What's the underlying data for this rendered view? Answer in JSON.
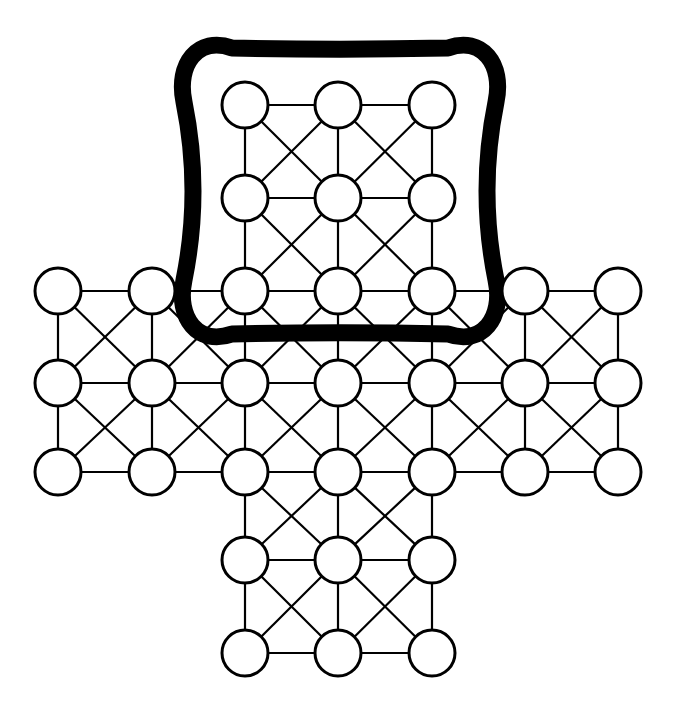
{
  "figure": {
    "background_color": "#ffffff",
    "stroke_color": "#000000",
    "node_fill_color": "#ffffff",
    "width": 683,
    "height": 707
  },
  "chart_data": {
    "type": "diagram",
    "xlabel": "",
    "ylabel": "",
    "grid": false,
    "legend": "none",
    "node_radius": 23,
    "column_x": [
      58,
      152,
      245,
      338,
      432,
      525,
      618
    ],
    "row_y": [
      105,
      198,
      291,
      383,
      472,
      560,
      653
    ],
    "node_count": 33,
    "nodes": [
      {
        "id": "n-r0c2",
        "row": 0,
        "col": 2,
        "x": 245,
        "y": 105,
        "highlighted": true
      },
      {
        "id": "n-r0c3",
        "row": 0,
        "col": 3,
        "x": 338,
        "y": 105,
        "highlighted": true
      },
      {
        "id": "n-r0c4",
        "row": 0,
        "col": 4,
        "x": 432,
        "y": 105,
        "highlighted": true
      },
      {
        "id": "n-r1c2",
        "row": 1,
        "col": 2,
        "x": 245,
        "y": 198,
        "highlighted": true
      },
      {
        "id": "n-r1c3",
        "row": 1,
        "col": 3,
        "x": 338,
        "y": 198,
        "highlighted": true
      },
      {
        "id": "n-r1c4",
        "row": 1,
        "col": 4,
        "x": 432,
        "y": 198,
        "highlighted": true
      },
      {
        "id": "n-r2c0",
        "row": 2,
        "col": 0,
        "x": 58,
        "y": 291,
        "highlighted": false
      },
      {
        "id": "n-r2c1",
        "row": 2,
        "col": 1,
        "x": 152,
        "y": 291,
        "highlighted": false
      },
      {
        "id": "n-r2c2",
        "row": 2,
        "col": 2,
        "x": 245,
        "y": 291,
        "highlighted": true
      },
      {
        "id": "n-r2c3",
        "row": 2,
        "col": 3,
        "x": 338,
        "y": 291,
        "highlighted": true
      },
      {
        "id": "n-r2c4",
        "row": 2,
        "col": 4,
        "x": 432,
        "y": 291,
        "highlighted": true
      },
      {
        "id": "n-r2c5",
        "row": 2,
        "col": 5,
        "x": 525,
        "y": 291,
        "highlighted": false
      },
      {
        "id": "n-r2c6",
        "row": 2,
        "col": 6,
        "x": 618,
        "y": 291,
        "highlighted": false
      },
      {
        "id": "n-r3c0",
        "row": 3,
        "col": 0,
        "x": 58,
        "y": 383,
        "highlighted": false
      },
      {
        "id": "n-r3c1",
        "row": 3,
        "col": 1,
        "x": 152,
        "y": 383,
        "highlighted": false
      },
      {
        "id": "n-r3c2",
        "row": 3,
        "col": 2,
        "x": 245,
        "y": 383,
        "highlighted": false
      },
      {
        "id": "n-r3c3",
        "row": 3,
        "col": 3,
        "x": 338,
        "y": 383,
        "highlighted": false
      },
      {
        "id": "n-r3c4",
        "row": 3,
        "col": 4,
        "x": 432,
        "y": 383,
        "highlighted": false
      },
      {
        "id": "n-r3c5",
        "row": 3,
        "col": 5,
        "x": 525,
        "y": 383,
        "highlighted": false
      },
      {
        "id": "n-r3c6",
        "row": 3,
        "col": 6,
        "x": 618,
        "y": 383,
        "highlighted": false
      },
      {
        "id": "n-r4c0",
        "row": 4,
        "col": 0,
        "x": 58,
        "y": 472,
        "highlighted": false
      },
      {
        "id": "n-r4c1",
        "row": 4,
        "col": 1,
        "x": 152,
        "y": 472,
        "highlighted": false
      },
      {
        "id": "n-r4c2",
        "row": 4,
        "col": 2,
        "x": 245,
        "y": 472,
        "highlighted": false
      },
      {
        "id": "n-r4c3",
        "row": 4,
        "col": 3,
        "x": 338,
        "y": 472,
        "highlighted": false
      },
      {
        "id": "n-r4c4",
        "row": 4,
        "col": 4,
        "x": 432,
        "y": 472,
        "highlighted": false
      },
      {
        "id": "n-r4c5",
        "row": 4,
        "col": 5,
        "x": 525,
        "y": 472,
        "highlighted": false
      },
      {
        "id": "n-r4c6",
        "row": 4,
        "col": 6,
        "x": 618,
        "y": 472,
        "highlighted": false
      },
      {
        "id": "n-r5c2",
        "row": 5,
        "col": 2,
        "x": 245,
        "y": 560,
        "highlighted": false
      },
      {
        "id": "n-r5c3",
        "row": 5,
        "col": 3,
        "x": 338,
        "y": 560,
        "highlighted": false
      },
      {
        "id": "n-r5c4",
        "row": 5,
        "col": 4,
        "x": 432,
        "y": 560,
        "highlighted": false
      },
      {
        "id": "n-r6c2",
        "row": 6,
        "col": 2,
        "x": 245,
        "y": 653,
        "highlighted": false
      },
      {
        "id": "n-r6c3",
        "row": 6,
        "col": 3,
        "x": 338,
        "y": 653,
        "highlighted": false
      },
      {
        "id": "n-r6c4",
        "row": 6,
        "col": 4,
        "x": 432,
        "y": 653,
        "highlighted": false
      }
    ],
    "blocks": [
      {
        "name": "top-arm",
        "rows": [
          0,
          1,
          2
        ],
        "cols": [
          2,
          3,
          4
        ]
      },
      {
        "name": "left-arm",
        "rows": [
          2,
          3,
          4
        ],
        "cols": [
          0,
          1,
          2
        ]
      },
      {
        "name": "center",
        "rows": [
          2,
          3,
          4
        ],
        "cols": [
          2,
          3,
          4
        ]
      },
      {
        "name": "right-arm",
        "rows": [
          2,
          3,
          4
        ],
        "cols": [
          4,
          5,
          6
        ]
      },
      {
        "name": "bottom-arm",
        "rows": [
          4,
          5,
          6
        ],
        "cols": [
          2,
          3,
          4
        ]
      }
    ],
    "edge_style": {
      "orthogonal_stroke_width": 2.2,
      "diagonal_stroke_width": 2.2,
      "node_stroke_width": 3.0
    },
    "highlight": {
      "label": "highlighted-subgraph",
      "shape": "cushion-squircle",
      "encloses_rows": [
        0,
        1,
        2
      ],
      "encloses_cols": [
        2,
        3,
        4
      ],
      "enclosed_node_count": 9,
      "stroke_color": "#000000",
      "stroke_width": 13,
      "dash_pattern": "17 11",
      "backing_stroke_width": 17,
      "bbox": {
        "x": 180,
        "y": 42,
        "width": 320,
        "height": 298
      }
    }
  }
}
